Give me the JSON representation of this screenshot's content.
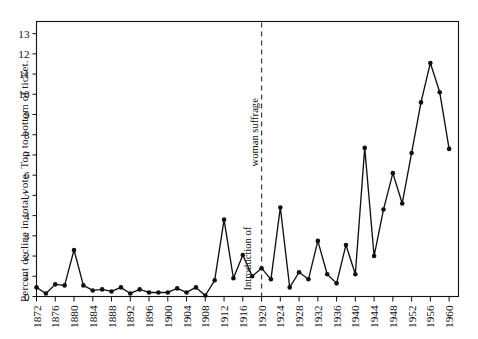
{
  "chart_data": {
    "type": "line",
    "title": "",
    "subtitle": "",
    "xlabel": "",
    "ylabel": "Percent decline in total vote. Top to bottom of ticket.",
    "xlim": [
      1872,
      1962
    ],
    "ylim": [
      0,
      13.6
    ],
    "y_ticks": [
      0,
      1,
      2,
      3,
      4,
      5,
      6,
      7,
      8,
      9,
      10,
      11,
      12,
      13
    ],
    "x_ticks": [
      1872,
      1876,
      1880,
      1884,
      1888,
      1892,
      1896,
      1900,
      1904,
      1908,
      1912,
      1916,
      1920,
      1924,
      1928,
      1932,
      1936,
      1940,
      1944,
      1948,
      1952,
      1956,
      1960
    ],
    "x_tick_labels": [
      "1872",
      "1876",
      "1880",
      "1884",
      "1888",
      "1892",
      "1896",
      "1900",
      "1904",
      "1908",
      "1912",
      "1916",
      "1920",
      "1924",
      "1928",
      "1932",
      "1936",
      "1940",
      "1944",
      "1948",
      "1952",
      "1956",
      "1960"
    ],
    "grid": false,
    "legend": null,
    "markers": "filled-circle",
    "line_color": "#111111",
    "marker_color": "#111111",
    "x": [
      1872,
      1874,
      1876,
      1878,
      1880,
      1882,
      1884,
      1886,
      1888,
      1890,
      1892,
      1894,
      1896,
      1898,
      1900,
      1902,
      1904,
      1906,
      1908,
      1910,
      1912,
      1914,
      1916,
      1918,
      1920,
      1922,
      1924,
      1926,
      1928,
      1930,
      1932,
      1934,
      1936,
      1938,
      1940,
      1942,
      1944,
      1946,
      1948,
      1950,
      1952,
      1954,
      1956,
      1958,
      1960
    ],
    "y": [
      0.45,
      0.15,
      0.6,
      0.55,
      2.3,
      0.55,
      0.3,
      0.35,
      0.25,
      0.45,
      0.15,
      0.35,
      0.2,
      0.2,
      0.2,
      0.4,
      0.2,
      0.45,
      0.05,
      0.8,
      3.8,
      0.9,
      2.05,
      1.0,
      1.4,
      0.85,
      4.4,
      0.45,
      1.2,
      0.85,
      2.75,
      1.1,
      0.65,
      2.55,
      1.1,
      7.35,
      2.0,
      4.3,
      6.1,
      4.6,
      7.1,
      9.6,
      11.55,
      10.1,
      7.3,
      7.6,
      6.6,
      7.25,
      7.35,
      9.25,
      6.9,
      8.6,
      7.3,
      6.05,
      7.1,
      7.3,
      10.0,
      7.2,
      9.7,
      7.0,
      8.2,
      7.4
    ],
    "series_points": [
      {
        "year": 1872,
        "value": 0.45
      },
      {
        "year": 1874,
        "value": 0.15
      },
      {
        "year": 1876,
        "value": 0.6
      },
      {
        "year": 1878,
        "value": 0.55
      },
      {
        "year": 1880,
        "value": 2.3
      },
      {
        "year": 1882,
        "value": 0.55
      },
      {
        "year": 1884,
        "value": 0.3
      },
      {
        "year": 1886,
        "value": 0.35
      },
      {
        "year": 1888,
        "value": 0.25
      },
      {
        "year": 1890,
        "value": 0.45
      },
      {
        "year": 1892,
        "value": 0.15
      },
      {
        "year": 1894,
        "value": 0.35
      },
      {
        "year": 1896,
        "value": 0.2
      },
      {
        "year": 1898,
        "value": 0.2
      },
      {
        "year": 1900,
        "value": 0.2
      },
      {
        "year": 1902,
        "value": 0.4
      },
      {
        "year": 1904,
        "value": 0.2
      },
      {
        "year": 1906,
        "value": 0.45
      },
      {
        "year": 1908,
        "value": 0.05
      },
      {
        "year": 1910,
        "value": 0.8
      },
      {
        "year": 1912,
        "value": 3.8
      },
      {
        "year": 1914,
        "value": 0.9
      },
      {
        "year": 1916,
        "value": 2.05
      },
      {
        "year": 1918,
        "value": 1.0
      },
      {
        "year": 1920,
        "value": 1.4
      },
      {
        "year": 1922,
        "value": 0.85
      },
      {
        "year": 1924,
        "value": 4.4
      },
      {
        "year": 1926,
        "value": 0.45
      },
      {
        "year": 1928,
        "value": 1.2
      },
      {
        "year": 1930,
        "value": 0.85
      },
      {
        "year": 1932,
        "value": 2.75
      },
      {
        "year": 1934,
        "value": 1.1
      },
      {
        "year": 1936,
        "value": 0.65
      },
      {
        "year": 1938,
        "value": 2.55
      },
      {
        "year": 1940,
        "value": 1.1
      },
      {
        "year": 1942,
        "value": 7.35
      },
      {
        "year": 1944,
        "value": 2.0
      },
      {
        "year": 1946,
        "value": 4.3
      },
      {
        "year": 1948,
        "value": 6.1
      },
      {
        "year": 1950,
        "value": 4.6
      },
      {
        "year": 1952,
        "value": 7.1
      },
      {
        "year": 1954,
        "value": 9.6
      },
      {
        "year": 1956,
        "value": 11.55
      },
      {
        "year": 1958,
        "value": 10.1
      },
      {
        "year": 1960,
        "value": 7.3
      }
    ],
    "annotations": [
      {
        "name": "woman-suffrage-line",
        "type": "vertical-dashed-line",
        "x": 1920,
        "label_line1": "Introduction of",
        "label_line2": "woman suffrage",
        "orientation": "vertical"
      }
    ]
  },
  "axis": {
    "ylabel": "Percent decline in total vote. Top to bottom of ticket."
  },
  "annotation": {
    "line1": "Introduction of",
    "line2": "woman suffrage"
  }
}
